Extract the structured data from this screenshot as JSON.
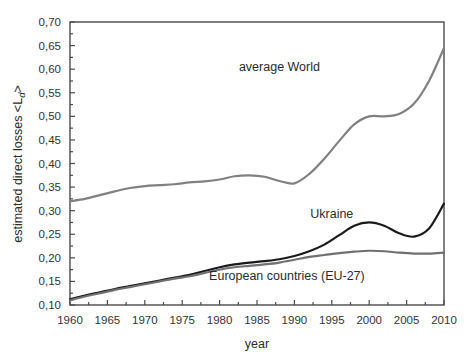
{
  "chart_data": {
    "type": "line",
    "title": "",
    "xlabel": "year",
    "ylabel": "estimated direct losses",
    "ylabel_symbol": "<L",
    "ylabel_symbol_sub": "d",
    "ylabel_symbol_end": ">",
    "xlim": [
      1960,
      2010
    ],
    "ylim": [
      0.1,
      0.7
    ],
    "grid": false,
    "legend": "inline-annotations",
    "xticks": [
      1960,
      1965,
      1970,
      1975,
      1980,
      1985,
      1990,
      1995,
      2000,
      2005,
      2010
    ],
    "xtick_labels": [
      "1960",
      "1965",
      "1970",
      "1975",
      "1980",
      "1985",
      "1990",
      "1995",
      "2000",
      "2005",
      "2010"
    ],
    "yticks": [
      0.1,
      0.15,
      0.2,
      0.25,
      0.3,
      0.35,
      0.4,
      0.45,
      0.5,
      0.55,
      0.6,
      0.65,
      0.7
    ],
    "ytick_labels": [
      "0,10",
      "0,15",
      "0,20",
      "0,25",
      "0,30",
      "0,35",
      "0,40",
      "0,45",
      "0,50",
      "0,55",
      "0,60",
      "0,65",
      "0,70"
    ],
    "x": [
      1960,
      1962,
      1964,
      1966,
      1968,
      1970,
      1972,
      1974,
      1976,
      1978,
      1980,
      1982,
      1984,
      1986,
      1988,
      1990,
      1992,
      1994,
      1996,
      1998,
      2000,
      2002,
      2004,
      2006,
      2008,
      2010
    ],
    "series": [
      {
        "name": "average World",
        "color": "#808080",
        "width": 2.2,
        "label_x": 1988,
        "label_y": 0.605,
        "values": [
          0.32,
          0.325,
          0.333,
          0.341,
          0.348,
          0.352,
          0.354,
          0.356,
          0.36,
          0.362,
          0.366,
          0.373,
          0.375,
          0.372,
          0.363,
          0.358,
          0.378,
          0.41,
          0.448,
          0.483,
          0.5,
          0.5,
          0.505,
          0.527,
          0.575,
          0.645
        ]
      },
      {
        "name": "Ukraine",
        "color": "#1a1a1a",
        "width": 2.2,
        "label_x": 1995,
        "label_y": 0.292,
        "values": [
          0.112,
          0.12,
          0.127,
          0.134,
          0.14,
          0.146,
          0.152,
          0.158,
          0.164,
          0.172,
          0.18,
          0.186,
          0.19,
          0.193,
          0.197,
          0.204,
          0.214,
          0.228,
          0.248,
          0.268,
          0.275,
          0.268,
          0.252,
          0.245,
          0.262,
          0.315
        ]
      },
      {
        "name": "European countries (EU-27)",
        "color": "#707070",
        "width": 2.2,
        "label_x": 1989,
        "label_y": 0.162,
        "values": [
          0.11,
          0.118,
          0.125,
          0.132,
          0.138,
          0.144,
          0.15,
          0.156,
          0.161,
          0.168,
          0.175,
          0.18,
          0.183,
          0.186,
          0.19,
          0.196,
          0.202,
          0.206,
          0.21,
          0.213,
          0.215,
          0.214,
          0.211,
          0.209,
          0.209,
          0.211
        ]
      }
    ]
  },
  "plot_geometry": {
    "left": 70,
    "right": 444,
    "top": 22,
    "bottom": 305
  }
}
